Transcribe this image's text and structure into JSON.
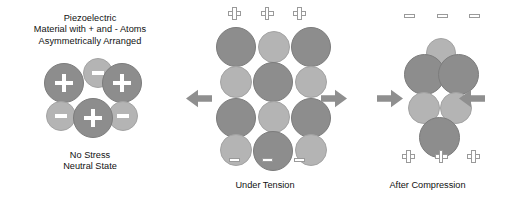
{
  "figure": {
    "background_color": "#ffffff"
  },
  "colors": {
    "positive_atom": "#8d8d8d",
    "negative_atom": "#b4b4b4",
    "symbol": "#ffffff",
    "charge_outline": "#9a9a9a",
    "arrow": "#8f8f8f",
    "text": "#111111"
  },
  "panels": {
    "neutral": {
      "heading": {
        "line1": "Piezoelectric",
        "line2": "Material with + and - Atoms",
        "line3": "Asymmetrically Arranged"
      },
      "caption": {
        "line1": "No Stress",
        "line2": "Neutral State"
      },
      "atoms": [
        {
          "name": "atom-neg-top",
          "charge": "-",
          "symbol": "minus",
          "x": 83,
          "y": 58,
          "d": 30
        },
        {
          "name": "atom-pos-upper-left",
          "charge": "+",
          "symbol": "plus",
          "x": 44,
          "y": 63,
          "d": 40
        },
        {
          "name": "atom-pos-upper-right",
          "charge": "+",
          "symbol": "plus",
          "x": 102,
          "y": 63,
          "d": 40
        },
        {
          "name": "atom-neg-left",
          "charge": "-",
          "symbol": "minus",
          "x": 46,
          "y": 101,
          "d": 30
        },
        {
          "name": "atom-neg-right",
          "charge": "-",
          "symbol": "minus",
          "x": 108,
          "y": 101,
          "d": 30
        },
        {
          "name": "atom-pos-bottom",
          "charge": "+",
          "symbol": "plus",
          "x": 73,
          "y": 98,
          "d": 40
        }
      ]
    },
    "tension": {
      "caption": "Under Tension",
      "top_charges": {
        "sign": "+",
        "count": 3
      },
      "bottom_charges": {
        "sign": "-",
        "count": 3
      },
      "arrows": [
        {
          "name": "tension-arrow-left",
          "direction": "left"
        },
        {
          "name": "tension-arrow-right",
          "direction": "right"
        }
      ],
      "atoms": [
        {
          "name": "atom-pos-r1c1",
          "charge": "+",
          "x": 216,
          "y": 27,
          "d": 40
        },
        {
          "name": "atom-neg-r1c2",
          "charge": "-",
          "x": 258,
          "y": 31,
          "d": 32
        },
        {
          "name": "atom-pos-r1c3",
          "charge": "+",
          "x": 291,
          "y": 27,
          "d": 40
        },
        {
          "name": "atom-neg-r2c1",
          "charge": "-",
          "x": 220,
          "y": 66,
          "d": 32
        },
        {
          "name": "atom-pos-r2c2",
          "charge": "+",
          "x": 253,
          "y": 62,
          "d": 40
        },
        {
          "name": "atom-neg-r2c3",
          "charge": "-",
          "x": 295,
          "y": 66,
          "d": 32
        },
        {
          "name": "atom-pos-r3c1",
          "charge": "+",
          "x": 216,
          "y": 98,
          "d": 40
        },
        {
          "name": "atom-neg-r3c2",
          "charge": "-",
          "x": 258,
          "y": 101,
          "d": 32
        },
        {
          "name": "atom-pos-r3c3",
          "charge": "+",
          "x": 291,
          "y": 98,
          "d": 40
        },
        {
          "name": "atom-neg-r4c1",
          "charge": "-",
          "x": 220,
          "y": 134,
          "d": 32
        },
        {
          "name": "atom-pos-r4c2",
          "charge": "+",
          "x": 253,
          "y": 131,
          "d": 40
        },
        {
          "name": "atom-neg-r4c3",
          "charge": "-",
          "x": 295,
          "y": 134,
          "d": 32
        }
      ]
    },
    "compression": {
      "caption": "After Compression",
      "top_charges": {
        "sign": "-",
        "count": 3
      },
      "bottom_charges": {
        "sign": "+",
        "count": 3
      },
      "arrows": [
        {
          "name": "compression-arrow-left",
          "direction": "right"
        },
        {
          "name": "compression-arrow-right",
          "direction": "left"
        }
      ],
      "atoms": [
        {
          "name": "atom-neg-top",
          "charge": "-",
          "x": 426,
          "y": 38,
          "d": 30
        },
        {
          "name": "atom-pos-upper-left",
          "charge": "+",
          "x": 404,
          "y": 54,
          "d": 41
        },
        {
          "name": "atom-pos-upper-right",
          "charge": "+",
          "x": 438,
          "y": 54,
          "d": 41
        },
        {
          "name": "atom-neg-mid-left",
          "charge": "-",
          "x": 408,
          "y": 92,
          "d": 32
        },
        {
          "name": "atom-neg-mid-right",
          "charge": "-",
          "x": 440,
          "y": 92,
          "d": 32
        },
        {
          "name": "atom-pos-bottom",
          "charge": "+",
          "x": 419,
          "y": 117,
          "d": 41
        }
      ]
    }
  }
}
